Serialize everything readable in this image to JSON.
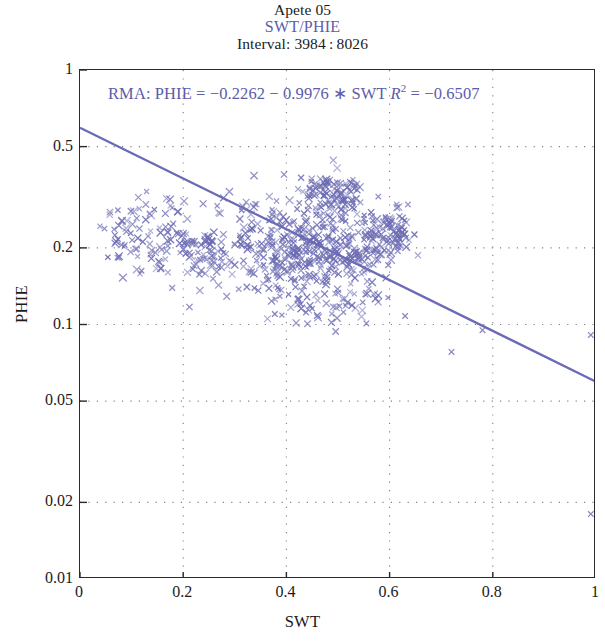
{
  "titles": {
    "main": "Apete 05",
    "sub": "SWT/PHIE",
    "interval": "Interval: 3984 : 8026"
  },
  "annotation": {
    "prefix": "RMA: PHIE = −0.2262 − 0.9976 ∗ SWT",
    "r_symbol": "R",
    "r_exponent": "2",
    "r_value": "= −0.6507",
    "full": "RMA: PHIE = −0.2262 − 0.9976 ∗ SWT R2 = −0.6507"
  },
  "axes": {
    "xlabel": "SWT",
    "ylabel": "PHIE",
    "xticks": [
      "0",
      "0.2",
      "0.4",
      "0.6",
      "0.8",
      "1"
    ],
    "yticks": [
      "1",
      "0.5",
      "0.2",
      "0.1",
      "0.05",
      "0.02",
      "0.01"
    ]
  },
  "colors": {
    "marker": "#6b6bb4",
    "line": "#6a6ab6",
    "grid": "#808080",
    "axis": "#2b2b2b",
    "title_accent": "#5c5ca8",
    "text": "#1b1b1b"
  },
  "chart_data": {
    "type": "scatter",
    "title": "Apete 05",
    "subtitle": "SWT/PHIE",
    "interval": "3984:8026",
    "xlabel": "SWT",
    "ylabel": "PHIE",
    "xscale": "linear",
    "yscale": "log",
    "xlim": [
      0,
      1
    ],
    "ylim": [
      0.01,
      1
    ],
    "xticks": [
      0,
      0.2,
      0.4,
      0.6,
      0.8,
      1
    ],
    "yticks": [
      1,
      0.5,
      0.2,
      0.1,
      0.05,
      0.02,
      0.01
    ],
    "grid": true,
    "grid_style": "dotted",
    "legend": null,
    "marker": "x",
    "marker_color": "#6b6bb4",
    "n_points": 520,
    "regression": {
      "method": "RMA",
      "label": "RMA: PHIE = −0.2262 − 0.9976 * SWT",
      "intercept": -0.2262,
      "slope": -0.9976,
      "r_squared": -0.6507,
      "line_space": "log10(PHIE) = -0.2262 - 0.9976 * SWT",
      "endpoints_xy": [
        [
          0.0,
          0.5935
        ],
        [
          1.0,
          0.0596
        ]
      ]
    },
    "clusters": [
      {
        "name": "left-tail",
        "x_range": [
          0.03,
          0.25
        ],
        "y_range": [
          0.13,
          0.33
        ],
        "n": 75
      },
      {
        "name": "mid-body",
        "x_range": [
          0.24,
          0.46
        ],
        "y_range": [
          0.12,
          0.3
        ],
        "n": 150
      },
      {
        "name": "core",
        "x_range": [
          0.4,
          0.58
        ],
        "y_range": [
          0.13,
          0.3
        ],
        "n": 160
      },
      {
        "name": "upper-lobe",
        "x_range": [
          0.43,
          0.56
        ],
        "y_range": [
          0.28,
          0.38
        ],
        "n": 70
      },
      {
        "name": "right-lobe",
        "x_range": [
          0.54,
          0.64
        ],
        "y_range": [
          0.16,
          0.28
        ],
        "n": 45
      },
      {
        "name": "low-outliers",
        "x_range": [
          0.35,
          0.75
        ],
        "y_range": [
          0.07,
          0.12
        ],
        "n": 15
      }
    ],
    "outliers": [
      {
        "x": 0.72,
        "y": 0.078
      },
      {
        "x": 0.78,
        "y": 0.095
      },
      {
        "x": 0.99,
        "y": 0.091
      },
      {
        "x": 0.99,
        "y": 0.018
      },
      {
        "x": 0.63,
        "y": 0.108
      },
      {
        "x": 0.555,
        "y": 0.101
      }
    ]
  }
}
